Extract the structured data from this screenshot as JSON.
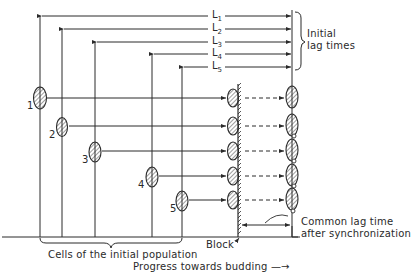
{
  "diagram": {
    "lag_labels": [
      "L1",
      "L2",
      "L3",
      "L4",
      "L5"
    ],
    "cell_numbers": [
      "1",
      "2",
      "3",
      "4",
      "5"
    ],
    "initial_lag_times": "Initial\nlag times",
    "initial_label_line1": "Initial",
    "initial_label_line2": "lag times",
    "cells_caption": "Cells of the initial population",
    "block_label": "Block",
    "progress_label": "Progress towards budding —→",
    "common_lag_line1": "Common lag time",
    "common_lag_line2": "after synchronization"
  },
  "colors": {
    "ink": "#2a2a2a",
    "background": "#ffffff"
  }
}
